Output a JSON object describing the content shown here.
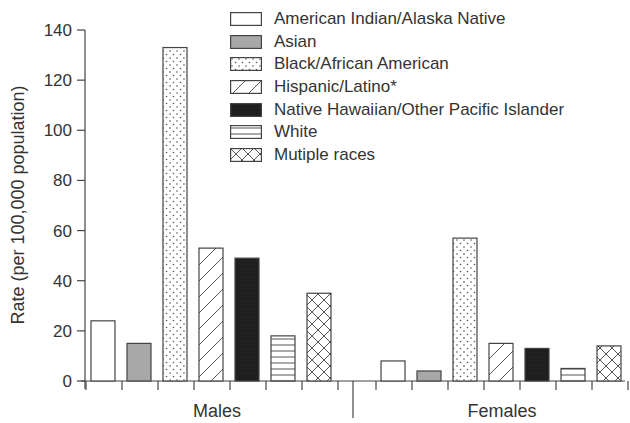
{
  "chart_data": {
    "type": "bar",
    "title": "",
    "xlabel": "",
    "ylabel": "Rate (per 100,000 population)",
    "ylim": [
      0,
      140
    ],
    "yticks": [
      0,
      20,
      40,
      60,
      80,
      100,
      120,
      140
    ],
    "grid": false,
    "legend_position": "top-right",
    "categories": [
      "Males",
      "Females"
    ],
    "series": [
      {
        "name": "American Indian/Alaska Native",
        "pattern": "white",
        "values": [
          24,
          8
        ]
      },
      {
        "name": "Asian",
        "pattern": "gray",
        "values": [
          15,
          4
        ]
      },
      {
        "name": "Black/African American",
        "pattern": "dots",
        "values": [
          133,
          57
        ]
      },
      {
        "name": "Hispanic/Latino*",
        "pattern": "diagonal",
        "values": [
          53,
          15
        ]
      },
      {
        "name": "Native Hawaiian/Other Pacific Islander",
        "pattern": "black",
        "values": [
          49,
          13
        ]
      },
      {
        "name": "White",
        "pattern": "horizontal",
        "values": [
          18,
          5
        ]
      },
      {
        "name": "Mutiple races",
        "pattern": "crosshatch",
        "values": [
          35,
          14
        ]
      }
    ]
  },
  "colors": {
    "axis": "#444444",
    "text": "#333333",
    "gray_fill": "#a8a8a8",
    "black_fill": "#1e1e1e"
  }
}
